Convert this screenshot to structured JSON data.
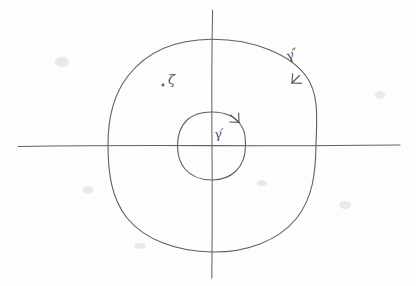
{
  "figure": {
    "kind": "hand-drawn-math-diagram",
    "background_color": "#fdfdfd",
    "ink_color": "#5b5b63",
    "width": 416,
    "height": 286
  },
  "axes": {
    "origin": {
      "x": 212,
      "y": 145.5
    },
    "horizontal": {
      "x1": 18,
      "y1": 145.5,
      "x2": 400,
      "y2": 145.5
    },
    "vertical": {
      "x1": 212,
      "y1": 10,
      "x2": 212,
      "y2": 278
    }
  },
  "contours": [
    {
      "id": "inner",
      "label": "γ′",
      "label_position": {
        "x": 218,
        "y": 137
      },
      "center": {
        "x": 211.5,
        "y": 146
      },
      "rx": 34,
      "ry": 34,
      "orientation": "clockwise",
      "arrow_angle_deg": -58,
      "axis_crossings": {
        "left": 177.5,
        "right": 245.5,
        "top": 112,
        "bottom": 180
      }
    },
    {
      "id": "outer",
      "label": "γ″",
      "label_position": {
        "x": 288,
        "y": 61
      },
      "center": {
        "x": 212,
        "y": 145.5
      },
      "rx": 104,
      "ry": 106,
      "orientation": "counterclockwise",
      "arrow_angle_deg": -46,
      "axis_crossings": {
        "left": 108,
        "right": 316,
        "top": 39,
        "bottom": 252
      }
    }
  ],
  "points": [
    {
      "id": "zeta",
      "label": "ζ",
      "dot_position": {
        "x": 163,
        "y": 84
      },
      "label_position": {
        "x": 168,
        "y": 84
      }
    }
  ]
}
